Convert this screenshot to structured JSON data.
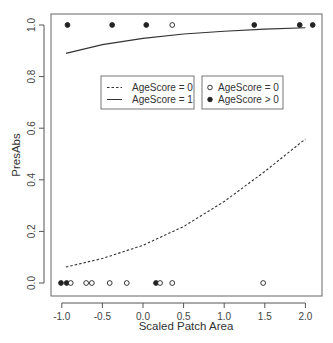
{
  "chart_data": {
    "type": "scatter",
    "title": "",
    "xlabel": "Scaled Patch Area",
    "ylabel": "PresAbs",
    "xlim": [
      -1.05,
      2.15
    ],
    "ylim": [
      -0.04,
      1.04
    ],
    "xticks": [
      -1.0,
      -0.5,
      0.0,
      0.5,
      1.0,
      1.5,
      2.0
    ],
    "xtick_labels": [
      "-1.0",
      "-0.5",
      "0.0",
      "0.5",
      "1.0",
      "1.5",
      "2.0"
    ],
    "yticks": [
      0.0,
      0.2,
      0.4,
      0.6,
      0.8,
      1.0
    ],
    "ytick_labels": [
      "0.0",
      "0.2",
      "0.4",
      "0.6",
      "0.8",
      "1.0"
    ],
    "grid": false,
    "points": [
      {
        "x": -0.93,
        "y": 1,
        "group": "AgeScore > 0"
      },
      {
        "x": -0.38,
        "y": 1,
        "group": "AgeScore > 0"
      },
      {
        "x": 0.04,
        "y": 1,
        "group": "AgeScore > 0"
      },
      {
        "x": 0.36,
        "y": 1,
        "group": "AgeScore = 0"
      },
      {
        "x": 1.37,
        "y": 1,
        "group": "AgeScore > 0"
      },
      {
        "x": 1.93,
        "y": 1,
        "group": "AgeScore > 0"
      },
      {
        "x": 2.09,
        "y": 1,
        "group": "AgeScore > 0"
      },
      {
        "x": -1.01,
        "y": 0,
        "group": "AgeScore > 0"
      },
      {
        "x": -0.94,
        "y": 0,
        "group": "AgeScore > 0"
      },
      {
        "x": -0.89,
        "y": 0,
        "group": "AgeScore = 0"
      },
      {
        "x": -0.7,
        "y": 0,
        "group": "AgeScore = 0"
      },
      {
        "x": -0.63,
        "y": 0,
        "group": "AgeScore = 0"
      },
      {
        "x": -0.41,
        "y": 0,
        "group": "AgeScore = 0"
      },
      {
        "x": -0.2,
        "y": 0,
        "group": "AgeScore = 0"
      },
      {
        "x": 0.16,
        "y": 0,
        "group": "AgeScore > 0"
      },
      {
        "x": 0.21,
        "y": 0,
        "group": "AgeScore = 0"
      },
      {
        "x": 0.36,
        "y": 0,
        "group": "AgeScore = 0"
      },
      {
        "x": 1.48,
        "y": 0,
        "group": "AgeScore = 0"
      }
    ],
    "series": [
      {
        "name": "AgeScore = 0",
        "style": "dashed",
        "x": [
          -0.95,
          -0.5,
          0.0,
          0.5,
          1.0,
          1.5,
          2.0
        ],
        "values": [
          0.062,
          0.095,
          0.146,
          0.219,
          0.316,
          0.432,
          0.558
        ]
      },
      {
        "name": "AgeScore = 1",
        "style": "solid",
        "x": [
          -0.95,
          -0.5,
          0.0,
          0.5,
          1.0,
          1.5,
          2.0
        ],
        "values": [
          0.89,
          0.924,
          0.948,
          0.965,
          0.976,
          0.984,
          0.989
        ]
      }
    ],
    "legends": [
      {
        "position": "center-left",
        "entries": [
          {
            "label": "AgeScore = 0",
            "symbol": "dashed-line"
          },
          {
            "label": "AgeScore = 1",
            "symbol": "solid-line"
          }
        ]
      },
      {
        "position": "center-right",
        "entries": [
          {
            "label": "AgeScore = 0",
            "symbol": "open-circle"
          },
          {
            "label": "AgeScore > 0",
            "symbol": "filled-circle"
          }
        ]
      }
    ],
    "colors": {
      "line": "#333333",
      "axis": "#555555",
      "point": "#222222"
    }
  }
}
